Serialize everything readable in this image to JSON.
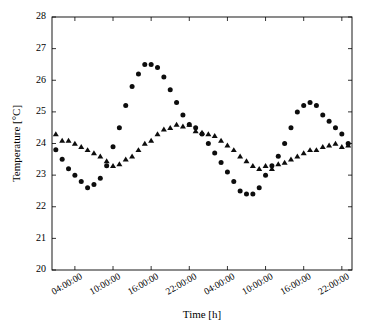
{
  "figure": {
    "background": "#ffffff",
    "foreground": "#000000",
    "marker_color": "#0d0d0d"
  },
  "axes": {
    "xlabel": "Time [h]",
    "ylabel": "Temperature [°C]",
    "ylabel_parts": {
      "text": "Temperature [",
      "degree": "°",
      "unit": "C]"
    },
    "ytick_labels": [
      "20",
      "21",
      "22",
      "23",
      "24",
      "25",
      "26",
      "27",
      "28"
    ],
    "xtick_labels": [
      "04:00:00",
      "10:00:00",
      "16:00:00",
      "22:00:00",
      "04:00:00",
      "10:00:00",
      "16:00:00",
      "22:00:00"
    ]
  },
  "chart_data": {
    "type": "scatter",
    "title": "",
    "xlabel": "Time [h]",
    "ylabel": "Temperature [°C]",
    "ylim": [
      20,
      28
    ],
    "ytick_values": [
      20,
      21,
      22,
      23,
      24,
      25,
      26,
      27,
      28
    ],
    "xlim_hours": [
      1,
      47
    ],
    "xtick_hours": [
      4,
      10,
      16,
      22,
      28,
      34,
      40,
      46
    ],
    "xtick_labels": [
      "04:00:00",
      "10:00:00",
      "16:00:00",
      "22:00:00",
      "04:00:00",
      "10:00:00",
      "16:00:00",
      "22:00:00"
    ],
    "grid": false,
    "legend": "none",
    "series": [
      {
        "name": "series-circles",
        "marker": "circle",
        "color": "#0d0d0d",
        "x": [
          1,
          2,
          3,
          4,
          5,
          6,
          7,
          8,
          9,
          10,
          11,
          12,
          13,
          14,
          15,
          16,
          17,
          18,
          19,
          20,
          21,
          22,
          23,
          24,
          25,
          26,
          27,
          28,
          29,
          30,
          31,
          32,
          33,
          34,
          35,
          36,
          37,
          38,
          39,
          40,
          41,
          42,
          43,
          44,
          45,
          46,
          47
        ],
        "y": [
          23.8,
          23.5,
          23.2,
          23.0,
          22.8,
          22.6,
          22.7,
          22.9,
          23.3,
          23.9,
          24.5,
          25.2,
          25.8,
          26.2,
          26.5,
          26.5,
          26.4,
          26.1,
          25.7,
          25.3,
          24.9,
          24.6,
          24.5,
          24.3,
          24.0,
          23.7,
          23.4,
          23.1,
          22.8,
          22.5,
          22.4,
          22.4,
          22.6,
          23.0,
          23.3,
          23.6,
          24.0,
          24.5,
          25.0,
          25.2,
          25.3,
          25.2,
          24.9,
          24.7,
          24.5,
          24.3,
          24.0
        ]
      },
      {
        "name": "series-triangles",
        "marker": "triangle",
        "color": "#0d0d0d",
        "x": [
          1,
          2,
          3,
          4,
          5,
          6,
          7,
          8,
          9,
          10,
          11,
          12,
          13,
          14,
          15,
          16,
          17,
          18,
          19,
          20,
          21,
          22,
          23,
          24,
          25,
          26,
          27,
          28,
          29,
          30,
          31,
          32,
          33,
          34,
          35,
          36,
          37,
          38,
          39,
          40,
          41,
          42,
          43,
          44,
          45,
          46,
          47
        ],
        "y": [
          24.3,
          24.1,
          24.1,
          24.0,
          23.9,
          23.8,
          23.7,
          23.6,
          23.45,
          23.3,
          23.35,
          23.5,
          23.6,
          23.8,
          24.0,
          24.1,
          24.3,
          24.45,
          24.5,
          24.6,
          24.55,
          24.6,
          24.4,
          24.35,
          24.3,
          24.25,
          24.1,
          23.95,
          23.8,
          23.6,
          23.45,
          23.3,
          23.2,
          23.3,
          23.2,
          23.35,
          23.4,
          23.5,
          23.6,
          23.7,
          23.8,
          23.8,
          23.9,
          23.95,
          24.0,
          23.9,
          23.95
        ]
      }
    ]
  }
}
